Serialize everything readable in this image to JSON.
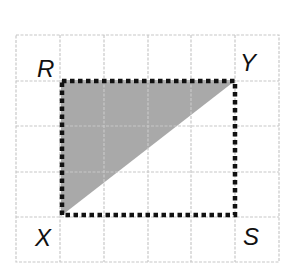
{
  "diagram": {
    "type": "grid-geometry",
    "grid": {
      "columns": 6,
      "rows": 5,
      "x_lines": [
        16,
        60,
        104,
        148,
        191,
        235,
        279
      ],
      "y_lines": [
        35,
        81,
        126,
        172,
        217,
        262
      ],
      "line_color": "#c8c8c8",
      "line_style": "dashed"
    },
    "rectangle": {
      "vertices": {
        "R": [
          61,
          80
        ],
        "Y": [
          236,
          80
        ],
        "S": [
          236,
          216
        ],
        "X": [
          61,
          216
        ]
      },
      "stroke_color": "#111111",
      "stroke_style": "dotted"
    },
    "shaded_triangle": {
      "vertices": [
        "R",
        "Y",
        "X"
      ],
      "fill_color": "#a9a9a9"
    },
    "labels": {
      "R": "R",
      "Y": "Y",
      "X": "X",
      "S": "S"
    }
  }
}
